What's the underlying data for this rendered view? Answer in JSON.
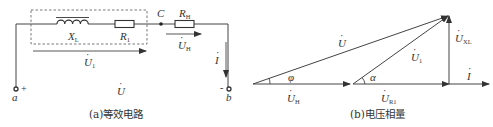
{
  "figure": {
    "panel_a": {
      "caption": "(a)等效电路",
      "components": {
        "inductor": {
          "label": "X",
          "label_sub": "L"
        },
        "resistor_1": {
          "label": "R",
          "label_sub": "1"
        },
        "resistor_h": {
          "label": "R",
          "label_sub": "H"
        }
      },
      "node_c": "C",
      "terminal_a": "a",
      "terminal_b": "b",
      "plus_sign": "+",
      "minus_sign": "-",
      "voltages": {
        "u1": {
          "label": "U",
          "dot": "·",
          "sub": "1"
        },
        "uh": {
          "label": "U",
          "dot": "·",
          "sub": "H"
        },
        "u": {
          "label": "U",
          "dot": "·"
        }
      },
      "current": {
        "label": "I",
        "dot": "·"
      }
    },
    "panel_b": {
      "caption": "(b)电压相量",
      "phasors": {
        "u": {
          "label": "U",
          "dot": "·"
        },
        "u1": {
          "label": "U",
          "dot": "·",
          "sub": "1"
        },
        "uh": {
          "label": "U",
          "dot": "·",
          "sub": "H"
        },
        "ur1": {
          "label": "U",
          "dot": "·",
          "sub": "R1"
        },
        "uxl": {
          "label": "U",
          "dot": "·",
          "sub": "XL"
        },
        "i": {
          "label": "I",
          "dot": "·"
        }
      },
      "angles": {
        "phi": "φ",
        "alpha": "α"
      }
    }
  }
}
